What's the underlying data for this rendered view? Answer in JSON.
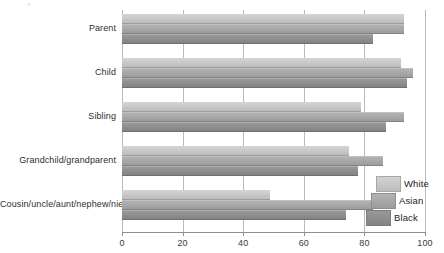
{
  "chart_data": {
    "type": "bar",
    "orientation": "horizontal",
    "title": "",
    "xlabel": "",
    "ylabel": "",
    "xlim": [
      0,
      100
    ],
    "xticks": [
      "0",
      "20",
      "40",
      "60",
      "80",
      "100"
    ],
    "grid": true,
    "legend_position": "bottom-right",
    "categories": [
      "Parent",
      "Child",
      "Sibling",
      "Grandchild/grandparent",
      "Cousin/uncle/aunt/nephew/niece"
    ],
    "series": [
      {
        "name": "White",
        "color": "#c6c6c6",
        "values": [
          93,
          92,
          79,
          75,
          49
        ]
      },
      {
        "name": "Asian",
        "color": "#a6a6a6",
        "values": [
          93,
          96,
          93,
          86,
          83
        ]
      },
      {
        "name": "Black",
        "color": "#8d8d8d",
        "values": [
          83,
          94,
          87,
          78,
          74
        ]
      }
    ]
  },
  "axis": {
    "tick_0": "0",
    "tick_20": "20",
    "tick_40": "40",
    "tick_60": "60",
    "tick_80": "80",
    "tick_100": "100"
  },
  "categories": {
    "parent": "Parent",
    "child": "Child",
    "sibling": "Sibling",
    "grandchild": "Grandchild/grandparent",
    "cousin": "Cousin/uncle/aunt/nephew/niece"
  },
  "legend": {
    "white": "White",
    "asian": "Asian",
    "black": "Black"
  }
}
